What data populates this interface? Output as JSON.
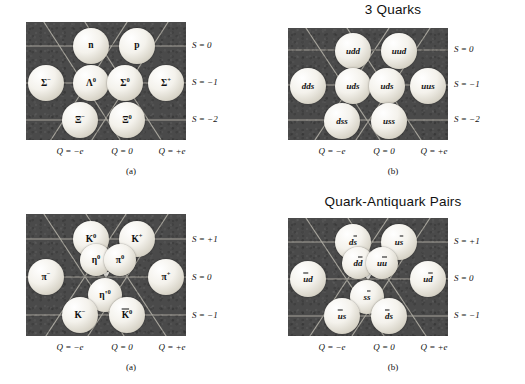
{
  "axes": {
    "q_labels": [
      "Q = −e",
      "Q = 0",
      "Q = +e"
    ],
    "s_top": [
      "S = 0",
      "S = −1",
      "S = −2"
    ],
    "s_bottom": [
      "S = +1",
      "S = 0",
      "S = −1"
    ]
  },
  "colors": {
    "plot_background": "#4a4a4a",
    "grid_line": "#b9b6ac",
    "node_fill": "#f4f2ec",
    "text": "#111111",
    "page": "#ffffff"
  },
  "panels": [
    {
      "id": "baryon-octet",
      "title": "",
      "sublabel": "(a)",
      "node_style": "sym",
      "nodes": [
        {
          "name": "neutron",
          "label": "n",
          "sup": "",
          "row": 0,
          "col": 1
        },
        {
          "name": "proton",
          "label": "p",
          "sup": "",
          "row": 0,
          "col": 2
        },
        {
          "name": "sigma-minus",
          "label": "Σ",
          "sup": "−",
          "row": 1,
          "col": 0
        },
        {
          "name": "lambda-zero",
          "label": "Λ",
          "sup": "0",
          "row": 1,
          "col": 1
        },
        {
          "name": "sigma-zero",
          "label": "Σ",
          "sup": "0",
          "row": 1,
          "col": 2
        },
        {
          "name": "sigma-plus",
          "label": "Σ",
          "sup": "+",
          "row": 1,
          "col": 3
        },
        {
          "name": "xi-minus",
          "label": "Ξ",
          "sup": "−",
          "row": 2,
          "col": 1
        },
        {
          "name": "xi-zero",
          "label": "Ξ",
          "sup": "0",
          "row": 2,
          "col": 2
        }
      ]
    },
    {
      "id": "baryon-quarks",
      "title": "3 Quarks",
      "sublabel": "(b)",
      "node_style": "qk",
      "nodes": [
        {
          "name": "quark-udd",
          "label": "udd",
          "row": 0,
          "col": 1
        },
        {
          "name": "quark-uud",
          "label": "uud",
          "row": 0,
          "col": 2
        },
        {
          "name": "quark-dds",
          "label": "dds",
          "row": 1,
          "col": 0
        },
        {
          "name": "quark-uds-lambda",
          "label": "uds",
          "row": 1,
          "col": 1
        },
        {
          "name": "quark-uds-sigma",
          "label": "uds",
          "row": 1,
          "col": 2
        },
        {
          "name": "quark-uus",
          "label": "uus",
          "row": 1,
          "col": 3
        },
        {
          "name": "quark-dss",
          "label": "dss",
          "row": 2,
          "col": 1
        },
        {
          "name": "quark-uss",
          "label": "uss",
          "row": 2,
          "col": 2
        }
      ]
    },
    {
      "id": "meson-nonet",
      "title": "",
      "sublabel": "(a)",
      "node_style": "sym",
      "nodes": [
        {
          "name": "kaon-zero",
          "label": "K",
          "sup": "0",
          "row": 0,
          "col": 1
        },
        {
          "name": "kaon-plus",
          "label": "K",
          "sup": "+",
          "row": 0,
          "col": 2
        },
        {
          "name": "eta-zero",
          "label": "η",
          "sup": "0",
          "row": "center-upper-left"
        },
        {
          "name": "pion-zero",
          "label": "π",
          "sup": "0",
          "row": "center-upper-right"
        },
        {
          "name": "pion-minus",
          "label": "π",
          "sup": "−",
          "row": 1,
          "col": 0
        },
        {
          "name": "pion-plus",
          "label": "π",
          "sup": "+",
          "row": 1,
          "col": 3
        },
        {
          "name": "eta-prime-zero",
          "label": "η'",
          "sup": "0",
          "row": "center-lower"
        },
        {
          "name": "kaon-minus",
          "label": "K",
          "sup": "−",
          "row": 2,
          "col": 1
        },
        {
          "name": "kaon-zero-bar",
          "label": "K",
          "sup": "0",
          "bar": true,
          "row": 2,
          "col": 2
        }
      ]
    },
    {
      "id": "meson-quarks",
      "title": "Quark-Antiquark Pairs",
      "sublabel": "(b)",
      "node_style": "qk",
      "nodes": [
        {
          "name": "quark-d-sbar",
          "plain": "d",
          "over": "s",
          "row": 0,
          "col": 1
        },
        {
          "name": "quark-u-sbar",
          "plain": "u",
          "over": "s",
          "row": 0,
          "col": 2
        },
        {
          "name": "quark-d-dbar",
          "plain": "d",
          "over": "d",
          "row": "center-upper-left"
        },
        {
          "name": "quark-u-ubar",
          "plain": "u",
          "over": "u",
          "row": "center-upper-right"
        },
        {
          "name": "quark-ubar-d",
          "pre": "u",
          "plain2": "d",
          "row": 1,
          "col": 0
        },
        {
          "name": "quark-u-dbar",
          "plain": "u",
          "over": "d",
          "row": 1,
          "col": 3
        },
        {
          "name": "quark-s-sbar",
          "plain": "s",
          "over": "s",
          "row": "center-lower"
        },
        {
          "name": "quark-ubar-s",
          "pre": "u",
          "plain2": "s",
          "row": 2,
          "col": 1
        },
        {
          "name": "quark-dbar-s",
          "pre": "d",
          "plain2": "s",
          "row": 2,
          "col": 2
        }
      ]
    }
  ]
}
